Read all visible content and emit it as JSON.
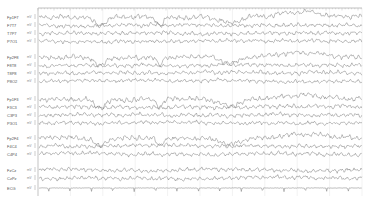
{
  "viewer": {
    "plot": {
      "x0": 38,
      "x1": 362,
      "y_top": 8,
      "y_bottom": 196
    },
    "ruler": {
      "tick_spacing": 3.2,
      "major_every": 5
    },
    "grid": {
      "vertical_lines_every": 32.4,
      "color": "#e4e4e4"
    },
    "trace_color": "#6a6a6a",
    "channels": [
      {
        "label": "Fp1F7",
        "scale": "mV",
        "y": 17,
        "amp": 2.2,
        "seed": 1,
        "artifact": "eyeblink"
      },
      {
        "label": "F7T7",
        "scale": "mV",
        "y": 25,
        "amp": 1.8,
        "seed": 2,
        "artifact": "none"
      },
      {
        "label": "T7P7",
        "scale": "mV",
        "y": 33,
        "amp": 1.8,
        "seed": 3,
        "artifact": "none"
      },
      {
        "label": "P7O1",
        "scale": "mV",
        "y": 41,
        "amp": 1.6,
        "seed": 4,
        "artifact": "none"
      },
      {
        "label": "Fp2F8",
        "scale": "mV",
        "y": 57,
        "amp": 2.2,
        "seed": 5,
        "artifact": "eyeblink"
      },
      {
        "label": "F8T8",
        "scale": "mV",
        "y": 65,
        "amp": 1.8,
        "seed": 6,
        "artifact": "none"
      },
      {
        "label": "T8P8",
        "scale": "mV",
        "y": 73,
        "amp": 1.8,
        "seed": 7,
        "artifact": "none"
      },
      {
        "label": "P8O2",
        "scale": "mV",
        "y": 81,
        "amp": 1.6,
        "seed": 8,
        "artifact": "none"
      },
      {
        "label": "Fp1F3",
        "scale": "mV",
        "y": 99,
        "amp": 2.2,
        "seed": 9,
        "artifact": "eyeblink"
      },
      {
        "label": "F3C3",
        "scale": "mV",
        "y": 107,
        "amp": 1.8,
        "seed": 10,
        "artifact": "none"
      },
      {
        "label": "C3P3",
        "scale": "mV",
        "y": 115,
        "amp": 1.8,
        "seed": 11,
        "artifact": "none"
      },
      {
        "label": "P3O1",
        "scale": "mV",
        "y": 123,
        "amp": 1.6,
        "seed": 12,
        "artifact": "none"
      },
      {
        "label": "Fp2F4",
        "scale": "mV",
        "y": 138,
        "amp": 2.2,
        "seed": 13,
        "artifact": "eyeblink"
      },
      {
        "label": "F4C4",
        "scale": "mV",
        "y": 146,
        "amp": 1.8,
        "seed": 14,
        "artifact": "none"
      },
      {
        "label": "C4P4",
        "scale": "mV",
        "y": 154,
        "amp": 1.8,
        "seed": 15,
        "artifact": "none"
      },
      {
        "label": "FzCz",
        "scale": "mV",
        "y": 170,
        "amp": 1.8,
        "seed": 16,
        "artifact": "none"
      },
      {
        "label": "CzPz",
        "scale": "mV",
        "y": 178,
        "amp": 1.8,
        "seed": 17,
        "artifact": "none"
      },
      {
        "label": "ECG",
        "scale": "mV",
        "y": 188,
        "amp": 0.6,
        "seed": 18,
        "artifact": "ecg"
      }
    ],
    "blinks_x": [
      100,
      160,
      230
    ],
    "ecg_period": 21.4,
    "ecg_offset": 48
  }
}
